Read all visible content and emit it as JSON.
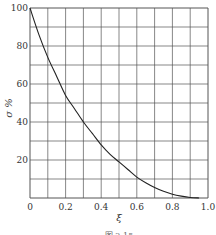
{
  "chart_data": {
    "type": "line",
    "title": "",
    "xlabel": "ξ",
    "ylabel": "σ %",
    "xlim": [
      0,
      1.0
    ],
    "ylim": [
      0,
      100
    ],
    "grid": true,
    "x_grid_step": 0.1,
    "y_grid_step": 10,
    "x_ticks": [
      0,
      0.2,
      0.4,
      0.6,
      0.8,
      1.0
    ],
    "x_tick_labels": [
      "0",
      "0.2",
      "0.4",
      "0.6",
      "0.8",
      "1.0"
    ],
    "y_ticks": [
      20,
      40,
      60,
      80,
      100
    ],
    "y_tick_labels": [
      "20",
      "40",
      "60",
      "80",
      "100"
    ],
    "series": [
      {
        "name": "σ vs ξ",
        "x": [
          0,
          0.05,
          0.1,
          0.15,
          0.2,
          0.25,
          0.3,
          0.35,
          0.4,
          0.45,
          0.5,
          0.55,
          0.6,
          0.65,
          0.7,
          0.75,
          0.8,
          0.85,
          0.9,
          0.95
        ],
        "y": [
          100,
          86,
          74,
          64,
          54,
          47,
          40,
          34,
          28,
          23,
          19,
          15,
          11,
          8,
          5.5,
          3.5,
          2,
          1,
          0.3,
          0
        ]
      }
    ],
    "caption": "图 2-15"
  }
}
